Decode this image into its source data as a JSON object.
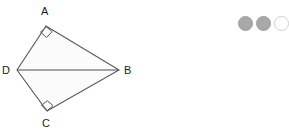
{
  "canvas": {
    "width": 289,
    "height": 135,
    "background": "#ffffff"
  },
  "figure": {
    "type": "quadrilateral-with-diagonal",
    "name": "kite ABCD",
    "fill_color": "#fbfbfb",
    "stroke_color": "#595959",
    "stroke_width": 1.1,
    "vertices": [
      {
        "id": "A",
        "label": "A",
        "x": 46,
        "y": 26,
        "right_angle": true,
        "label_x": 41,
        "label_y": 6
      },
      {
        "id": "B",
        "label": "B",
        "x": 119,
        "y": 70,
        "right_angle": false,
        "label_x": 124,
        "label_y": 65
      },
      {
        "id": "C",
        "label": "C",
        "x": 47,
        "y": 111,
        "right_angle": true,
        "label_x": 42,
        "label_y": 118
      },
      {
        "id": "D",
        "label": "D",
        "x": 17,
        "y": 70,
        "right_angle": false,
        "label_x": 2,
        "label_y": 65
      }
    ],
    "outline_path": "M46,26 L119,70 L47,111 L17,70 Z",
    "diagonal": {
      "from": "D",
      "to": "B",
      "x1": 17,
      "y1": 70,
      "x2": 119,
      "y2": 70
    },
    "right_angle_markers": [
      {
        "at": "A",
        "path": "M40.5,32.0 L46.5,37.5 L52.2,31.6 L46.4,27.0 Z"
      },
      {
        "at": "C",
        "path": "M41.5,105.3 L47.3,100.8 L53.0,105.6 L47.3,110.7 Z"
      }
    ]
  },
  "pagination": {
    "label": "page-indicator",
    "dots": [
      {
        "state": "filled",
        "color": "#a8a8a8"
      },
      {
        "state": "filled",
        "color": "#a8a8a8"
      },
      {
        "state": "hollow",
        "color": "#ffffff",
        "border": "#cfcfcf"
      }
    ]
  }
}
